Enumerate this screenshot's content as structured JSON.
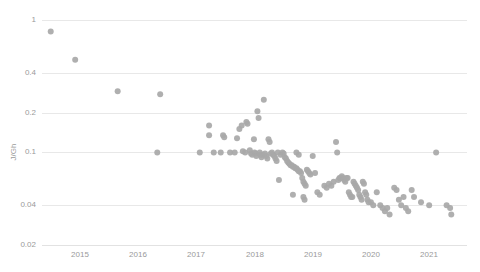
{
  "chart_data": {
    "type": "scatter",
    "title": "",
    "subtitle": "",
    "xlabel": "",
    "ylabel": "J/Gh",
    "yscale": "log",
    "xscale": "linear",
    "grid": true,
    "legend": false,
    "legend_position": "none",
    "xlim": [
      2014.35,
      2021.65
    ],
    "ylim": [
      0.02,
      1.15
    ],
    "x_ticks": [
      2015,
      2016,
      2017,
      2018,
      2019,
      2020,
      2021
    ],
    "x_tick_labels": [
      "2015",
      "2016",
      "2017",
      "2018",
      "2019",
      "2020",
      "2021"
    ],
    "y_ticks": [
      0.02,
      0.04,
      0.1,
      0.2,
      0.4,
      1
    ],
    "y_tick_labels": [
      "0.02",
      "0.04",
      "0.1",
      "0.2",
      "0.4",
      "1"
    ],
    "marker": {
      "shape": "circle",
      "color": "#a8a8a8",
      "size_px": 6,
      "opacity": 0.92
    },
    "series": [
      {
        "name": "Mining hardware efficiency",
        "points": [
          [
            2014.5,
            0.82
          ],
          [
            2014.92,
            0.5
          ],
          [
            2015.65,
            0.29
          ],
          [
            2016.38,
            0.275
          ],
          [
            2016.33,
            0.1
          ],
          [
            2017.06,
            0.1
          ],
          [
            2017.22,
            0.16
          ],
          [
            2017.22,
            0.135
          ],
          [
            2017.3,
            0.1
          ],
          [
            2017.42,
            0.1
          ],
          [
            2017.46,
            0.135
          ],
          [
            2017.48,
            0.13
          ],
          [
            2017.58,
            0.1
          ],
          [
            2017.66,
            0.1
          ],
          [
            2017.7,
            0.128
          ],
          [
            2017.74,
            0.15
          ],
          [
            2017.78,
            0.16
          ],
          [
            2017.8,
            0.102
          ],
          [
            2017.84,
            0.1
          ],
          [
            2017.86,
            0.17
          ],
          [
            2017.88,
            0.165
          ],
          [
            2017.92,
            0.104
          ],
          [
            2017.94,
            0.098
          ],
          [
            2017.96,
            0.096
          ],
          [
            2017.99,
            0.126
          ],
          [
            2018.0,
            0.1
          ],
          [
            2018.02,
            0.098
          ],
          [
            2018.03,
            0.094
          ],
          [
            2018.05,
            0.205
          ],
          [
            2018.07,
            0.182
          ],
          [
            2018.09,
            0.1
          ],
          [
            2018.1,
            0.096
          ],
          [
            2018.12,
            0.092
          ],
          [
            2018.14,
            0.096
          ],
          [
            2018.16,
            0.25
          ],
          [
            2018.18,
            0.098
          ],
          [
            2018.2,
            0.094
          ],
          [
            2018.22,
            0.09
          ],
          [
            2018.24,
            0.126
          ],
          [
            2018.26,
            0.12
          ],
          [
            2018.28,
            0.098
          ],
          [
            2018.3,
            0.1
          ],
          [
            2018.32,
            0.096
          ],
          [
            2018.34,
            0.094
          ],
          [
            2018.36,
            0.09
          ],
          [
            2018.38,
            0.086
          ],
          [
            2018.4,
            0.1
          ],
          [
            2018.42,
            0.062
          ],
          [
            2018.45,
            0.096
          ],
          [
            2018.48,
            0.1
          ],
          [
            2018.5,
            0.098
          ],
          [
            2018.52,
            0.092
          ],
          [
            2018.54,
            0.09
          ],
          [
            2018.56,
            0.086
          ],
          [
            2018.58,
            0.084
          ],
          [
            2018.6,
            0.082
          ],
          [
            2018.62,
            0.08
          ],
          [
            2018.64,
            0.08
          ],
          [
            2018.66,
            0.078
          ],
          [
            2018.68,
            0.078
          ],
          [
            2018.7,
            0.076
          ],
          [
            2018.72,
            0.076
          ],
          [
            2018.74,
            0.074
          ],
          [
            2018.76,
            0.072
          ],
          [
            2018.78,
            0.072
          ],
          [
            2018.8,
            0.07
          ],
          [
            2018.82,
            0.064
          ],
          [
            2018.84,
            0.06
          ],
          [
            2018.86,
            0.058
          ],
          [
            2018.88,
            0.056
          ],
          [
            2018.9,
            0.074
          ],
          [
            2018.92,
            0.072
          ],
          [
            2018.94,
            0.07
          ],
          [
            2018.96,
            0.068
          ],
          [
            2018.72,
            0.1
          ],
          [
            2018.76,
            0.096
          ],
          [
            2018.66,
            0.048
          ],
          [
            2018.84,
            0.046
          ],
          [
            2018.86,
            0.044
          ],
          [
            2019.0,
            0.094
          ],
          [
            2019.04,
            0.07
          ],
          [
            2019.08,
            0.05
          ],
          [
            2019.12,
            0.048
          ],
          [
            2019.2,
            0.056
          ],
          [
            2019.24,
            0.054
          ],
          [
            2019.28,
            0.058
          ],
          [
            2019.32,
            0.056
          ],
          [
            2019.36,
            0.06
          ],
          [
            2019.4,
            0.12
          ],
          [
            2019.42,
            0.1
          ],
          [
            2019.44,
            0.062
          ],
          [
            2019.46,
            0.064
          ],
          [
            2019.48,
            0.064
          ],
          [
            2019.5,
            0.066
          ],
          [
            2019.52,
            0.064
          ],
          [
            2019.54,
            0.062
          ],
          [
            2019.56,
            0.06
          ],
          [
            2019.58,
            0.064
          ],
          [
            2019.6,
            0.064
          ],
          [
            2019.62,
            0.05
          ],
          [
            2019.64,
            0.048
          ],
          [
            2019.66,
            0.046
          ],
          [
            2019.68,
            0.046
          ],
          [
            2019.7,
            0.06
          ],
          [
            2019.72,
            0.058
          ],
          [
            2019.74,
            0.056
          ],
          [
            2019.76,
            0.054
          ],
          [
            2019.78,
            0.052
          ],
          [
            2019.8,
            0.048
          ],
          [
            2019.82,
            0.046
          ],
          [
            2019.84,
            0.044
          ],
          [
            2019.86,
            0.06
          ],
          [
            2019.88,
            0.058
          ],
          [
            2019.9,
            0.05
          ],
          [
            2019.92,
            0.048
          ],
          [
            2019.94,
            0.044
          ],
          [
            2019.96,
            0.042
          ],
          [
            2020.0,
            0.042
          ],
          [
            2020.04,
            0.04
          ],
          [
            2020.1,
            0.05
          ],
          [
            2020.16,
            0.04
          ],
          [
            2020.2,
            0.038
          ],
          [
            2020.24,
            0.036
          ],
          [
            2020.28,
            0.038
          ],
          [
            2020.32,
            0.034
          ],
          [
            2020.4,
            0.054
          ],
          [
            2020.44,
            0.052
          ],
          [
            2020.48,
            0.044
          ],
          [
            2020.52,
            0.04
          ],
          [
            2020.56,
            0.046
          ],
          [
            2020.6,
            0.038
          ],
          [
            2020.64,
            0.036
          ],
          [
            2020.7,
            0.052
          ],
          [
            2020.74,
            0.046
          ],
          [
            2020.86,
            0.042
          ],
          [
            2021.0,
            0.04
          ],
          [
            2021.12,
            0.1
          ],
          [
            2021.3,
            0.04
          ],
          [
            2021.36,
            0.038
          ],
          [
            2021.38,
            0.034
          ]
        ]
      }
    ]
  },
  "axis": {
    "y_title": "J/Gh"
  }
}
